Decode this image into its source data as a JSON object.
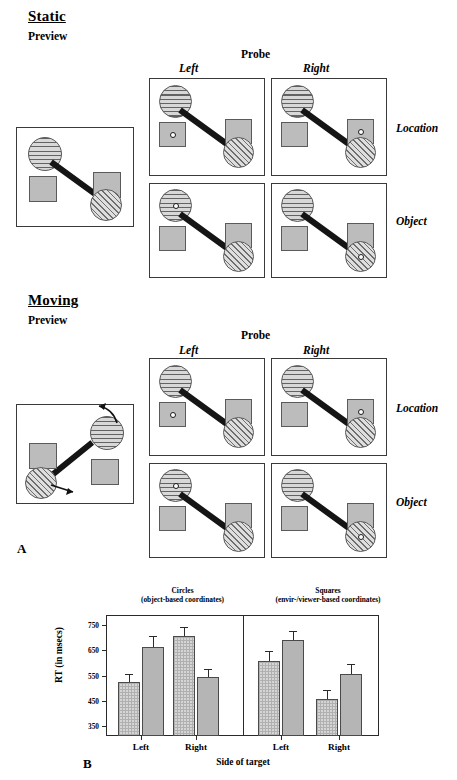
{
  "figure": {
    "panel_a_letter": "A",
    "panel_b_letter": "B"
  },
  "sections": [
    {
      "id": "static",
      "title": "Static",
      "preview_label": "Preview",
      "probe_label": "Probe",
      "col_left": "Left",
      "col_right": "Right",
      "row_location": "Location",
      "row_object": "Object"
    },
    {
      "id": "moving",
      "title": "Moving",
      "preview_label": "Preview",
      "probe_label": "Probe",
      "col_left": "Left",
      "col_right": "Right",
      "row_location": "Location",
      "row_object": "Object"
    }
  ],
  "stimulus": {
    "striped_circle_name": "striped-circle",
    "hatched_circle_name": "hatched-circle",
    "square_name": "gray-square",
    "connector_name": "connector-bar",
    "target_dot_name": "target-dot",
    "motion_arrow_name": "motion-arrow"
  },
  "chart_data": {
    "type": "bar",
    "title": "",
    "xlabel": "Side of target",
    "ylabel": "RT (in msecs)",
    "ylim": [
      310,
      790
    ],
    "yticks": [
      350,
      450,
      550,
      650,
      750
    ],
    "ytick_labels": [
      "350",
      "450",
      "550",
      "650",
      "750"
    ],
    "grid": false,
    "legend_position": "none",
    "group_headers": [
      {
        "line1": "Circles",
        "line2": "(object-based coordinates)"
      },
      {
        "line1": "Squares",
        "line2": "(envir-/viewer-based coordinates)"
      }
    ],
    "categories": [
      "Left",
      "Right",
      "Left",
      "Right"
    ],
    "series": [
      {
        "name": "Static",
        "pattern": "light-checkered",
        "values": [
          523,
          705,
          608,
          458
        ],
        "errors": [
          32,
          38,
          40,
          35
        ]
      },
      {
        "name": "Moving",
        "pattern": "solid-gray",
        "values": [
          663,
          546,
          690,
          556
        ],
        "errors": [
          45,
          30,
          35,
          40
        ]
      }
    ]
  }
}
